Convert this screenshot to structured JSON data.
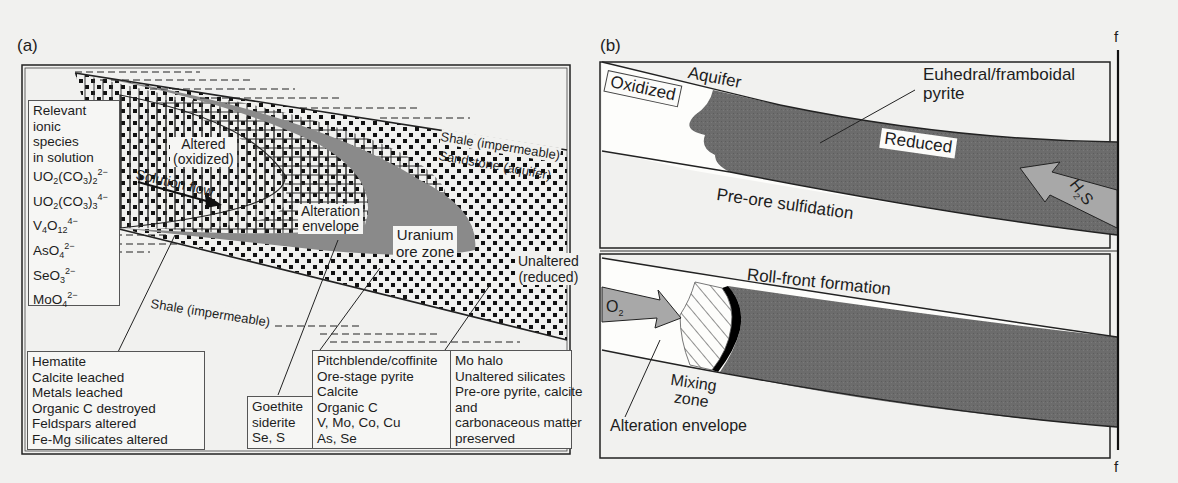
{
  "panel_a": {
    "label": "(a)",
    "ionic_box": {
      "heading": [
        "Relevant",
        "ionic",
        "species",
        "in solution"
      ],
      "species": [
        {
          "base": "UO",
          "sub1": "2",
          "mid": "(CO",
          "sub2": "3",
          "end": ")",
          "sub3": "2",
          "charge": "2−"
        },
        {
          "base": "UO",
          "sub1": "2",
          "mid": "(CO",
          "sub2": "3",
          "end": ")",
          "sub3": "3",
          "charge": "4−"
        },
        {
          "base": "V",
          "sub1": "4",
          "mid": "O",
          "sub2": "12",
          "end": "",
          "sub3": "",
          "charge": "4−"
        },
        {
          "base": "AsO",
          "sub1": "4",
          "mid": "",
          "sub2": "",
          "end": "",
          "sub3": "",
          "charge": "2−"
        },
        {
          "base": "SeO",
          "sub1": "3",
          "mid": "",
          "sub2": "",
          "end": "",
          "sub3": "",
          "charge": "2−"
        },
        {
          "base": "MoO",
          "sub1": "4",
          "mid": "",
          "sub2": "",
          "end": "",
          "sub3": "",
          "charge": "2−"
        }
      ]
    },
    "zones": {
      "altered_line1": "Altered",
      "altered_line2": "(oxidized)",
      "solution_flow": "Solution flow",
      "alteration_envelope_line1": "Alteration",
      "alteration_envelope_line2": "envelope",
      "uranium_line1": "Uranium",
      "uranium_line2": "ore zone",
      "unaltered_line1": "Unaltered",
      "unaltered_line2": "(reduced)",
      "shale_top": "Shale (impermeable)",
      "sandstone": "Sandstone (aquifer)",
      "shale_bottom": "Shale (impermeable)"
    },
    "callouts": {
      "altered": [
        "Hematite",
        "Calcite leached",
        "Metals leached",
        "Organic C destroyed",
        "Feldspars altered",
        "Fe-Mg silicates altered"
      ],
      "envelope": [
        "Goethite",
        "siderite",
        "Se, S"
      ],
      "ore": [
        "Pitchblende/coffinite",
        "Ore-stage pyrite",
        "Calcite",
        "Organic C",
        "V, Mo, Co, Cu",
        "As, Se"
      ],
      "unaltered": [
        "Mo halo",
        "Unaltered silicates",
        "Pre-ore pyrite, calcite",
        "and",
        "carbonaceous matter",
        "preserved"
      ]
    }
  },
  "panel_b": {
    "label": "(b)",
    "fault_label_top": "f",
    "fault_label_bottom": "f",
    "top": {
      "aquifer": "Aquifer",
      "oxidized": "Oxidized",
      "euhedral_line1": "Euhedral/framboidal",
      "euhedral_line2": "pyrite",
      "reduced": "Reduced",
      "pre_ore": "Pre-ore sulfidation",
      "h2s_base": "H",
      "h2s_sub": "2",
      "h2s_end": "S"
    },
    "bottom": {
      "roll_front": "Roll-front formation",
      "o2_base": "O",
      "o2_sub": "2",
      "mixing_line1": "Mixing",
      "mixing_line2": "zone",
      "alteration_envelope": "Alteration envelope"
    }
  },
  "colors": {
    "paper": "#f1f1ef",
    "ink": "#1d1d1d",
    "ore_gray": "#8a8a8a",
    "reduced_gray": "#6f6f6f",
    "arrow_gray": "#a8a8a8"
  }
}
